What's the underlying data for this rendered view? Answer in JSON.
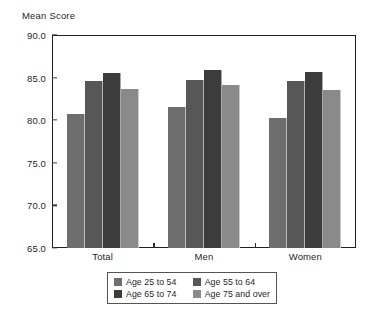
{
  "chart_data": {
    "type": "bar",
    "title": "",
    "ylabel": "Mean Score",
    "xlabel": "",
    "ylim": [
      65.0,
      90.0
    ],
    "yticks": [
      "65.0",
      "70.0",
      "75.0",
      "80.0",
      "85.0",
      "90.0"
    ],
    "ytick_values": [
      65.0,
      70.0,
      75.0,
      80.0,
      85.0,
      90.0
    ],
    "grid": false,
    "legend_position": "bottom",
    "categories": [
      "Total",
      "Men",
      "Women"
    ],
    "series": [
      {
        "name": "Age 25 to 54",
        "color": "#6e6e6e",
        "values": [
          80.7,
          81.5,
          80.2
        ]
      },
      {
        "name": "Age 55 to 64",
        "color": "#575757",
        "values": [
          84.6,
          84.7,
          84.6
        ]
      },
      {
        "name": "Age 65 to 74",
        "color": "#3c3c3c",
        "values": [
          85.5,
          85.9,
          85.6
        ]
      },
      {
        "name": "Age 75 and over",
        "color": "#8a8a8a",
        "values": [
          83.7,
          84.1,
          83.6
        ]
      }
    ]
  },
  "axis": {
    "y_title": "Mean Score"
  },
  "legend": {
    "items": [
      {
        "label": "Age 25 to 54"
      },
      {
        "label": "Age 55 to 64"
      },
      {
        "label": "Age 65 to 74"
      },
      {
        "label": "Age 75 and over"
      }
    ]
  },
  "colors": {
    "frame": "#231f20",
    "text": "#1f1f1f",
    "background": "#ffffff"
  }
}
